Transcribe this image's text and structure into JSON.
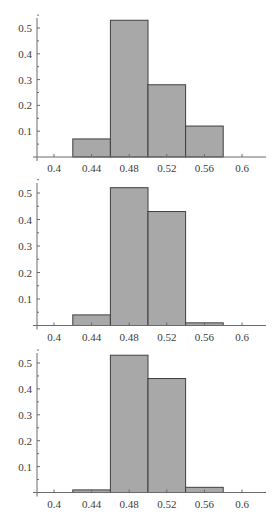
{
  "figure": {
    "panel_count": 3,
    "bar_fill": "#a8a8a8",
    "bar_stroke": "#3f3f3f",
    "axis_color": "#6a6a6a",
    "caption": ""
  },
  "chart_data": [
    {
      "type": "bar",
      "title": "",
      "xlabel": "",
      "ylabel": "",
      "bin_edges": [
        0.42,
        0.46,
        0.5,
        0.54,
        0.58
      ],
      "categories": [
        "0.42-0.46",
        "0.46-0.50",
        "0.50-0.54",
        "0.54-0.58"
      ],
      "values": [
        0.07,
        0.53,
        0.28,
        0.12
      ],
      "xlim": [
        0.38,
        0.62
      ],
      "ylim": [
        0,
        0.55
      ],
      "xticks": [
        "0.4",
        "0.44",
        "0.48",
        "0.52",
        "0.56",
        "0.6"
      ],
      "yticks": [
        "0.1",
        "0.2",
        "0.3",
        "0.4",
        "0.5"
      ],
      "grid": false,
      "legend": null
    },
    {
      "type": "bar",
      "title": "",
      "xlabel": "",
      "ylabel": "",
      "bin_edges": [
        0.42,
        0.46,
        0.5,
        0.54,
        0.58
      ],
      "categories": [
        "0.42-0.46",
        "0.46-0.50",
        "0.50-0.54",
        "0.54-0.58"
      ],
      "values": [
        0.04,
        0.52,
        0.43,
        0.01
      ],
      "xlim": [
        0.38,
        0.62
      ],
      "ylim": [
        0,
        0.55
      ],
      "xticks": [
        "0.4",
        "0.44",
        "0.48",
        "0.52",
        "0.56",
        "0.6"
      ],
      "yticks": [
        "0.1",
        "0.2",
        "0.3",
        "0.4",
        "0.5"
      ],
      "grid": false,
      "legend": null
    },
    {
      "type": "bar",
      "title": "",
      "xlabel": "",
      "ylabel": "",
      "bin_edges": [
        0.42,
        0.46,
        0.5,
        0.54,
        0.58
      ],
      "categories": [
        "0.42-0.46",
        "0.46-0.50",
        "0.50-0.54",
        "0.54-0.58"
      ],
      "values": [
        0.01,
        0.53,
        0.44,
        0.02
      ],
      "xlim": [
        0.38,
        0.62
      ],
      "ylim": [
        0,
        0.55
      ],
      "xticks": [
        "0.4",
        "0.44",
        "0.48",
        "0.52",
        "0.56",
        "0.6"
      ],
      "yticks": [
        "0.1",
        "0.2",
        "0.3",
        "0.4",
        "0.5"
      ],
      "grid": false,
      "legend": null
    }
  ]
}
